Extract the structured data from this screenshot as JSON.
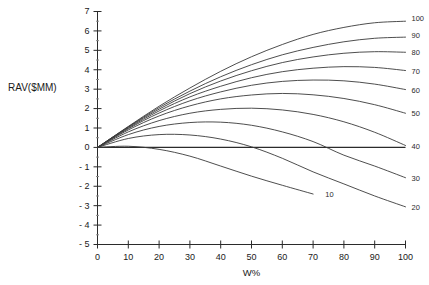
{
  "chart_data": {
    "type": "line",
    "title": "",
    "xlabel": "W%",
    "ylabel": "RAV($MM)",
    "xlim": [
      0,
      100
    ],
    "ylim": [
      -5,
      7
    ],
    "grid": false,
    "legend_position": "right-inline-labels",
    "x_ticks": [
      "0",
      "10",
      "20",
      "30",
      "40",
      "50",
      "60",
      "70",
      "80",
      "90",
      "100"
    ],
    "x_tick_values": [
      0,
      10,
      20,
      30,
      40,
      50,
      60,
      70,
      80,
      90,
      100
    ],
    "y_ticks": [
      "7",
      "6",
      "5",
      "4",
      "3",
      "2",
      "1",
      "0",
      "- 1",
      "- 2",
      "- 3",
      "- 4",
      "- 5"
    ],
    "y_tick_values": [
      7,
      6,
      5,
      4,
      3,
      2,
      1,
      0,
      -1,
      -2,
      -3,
      -4,
      -5
    ],
    "x": [
      0,
      10,
      20,
      30,
      40,
      50,
      60,
      70,
      80,
      90,
      100
    ],
    "series": [
      {
        "name": "100",
        "label": "100",
        "label_x": 100,
        "label_y": 6.6,
        "values": [
          0,
          1.08,
          2.12,
          3.06,
          3.92,
          4.67,
          5.3,
          5.82,
          6.18,
          6.42,
          6.5
        ]
      },
      {
        "name": "90",
        "label": "90",
        "label_x": 100,
        "label_y": 5.72,
        "values": [
          0,
          1.06,
          2.05,
          2.9,
          3.64,
          4.26,
          4.77,
          5.15,
          5.44,
          5.62,
          5.68
        ]
      },
      {
        "name": "80",
        "label": "80",
        "label_x": 100,
        "label_y": 4.85,
        "values": [
          0,
          1.04,
          1.97,
          2.77,
          3.42,
          3.95,
          4.37,
          4.66,
          4.85,
          4.93,
          4.9
        ]
      },
      {
        "name": "70",
        "label": "70",
        "label_x": 100,
        "label_y": 3.9,
        "values": [
          0,
          1.0,
          1.88,
          2.6,
          3.15,
          3.59,
          3.9,
          4.08,
          4.16,
          4.12,
          3.96
        ]
      },
      {
        "name": "60",
        "label": "60",
        "label_x": 100,
        "label_y": 2.92,
        "values": [
          0,
          0.96,
          1.77,
          2.4,
          2.86,
          3.2,
          3.4,
          3.47,
          3.43,
          3.26,
          2.98
        ]
      },
      {
        "name": "50",
        "label": "50",
        "label_x": 100,
        "label_y": 1.7,
        "values": [
          0,
          0.9,
          1.62,
          2.14,
          2.5,
          2.7,
          2.78,
          2.71,
          2.52,
          2.2,
          1.76
        ]
      },
      {
        "name": "40",
        "label": "40",
        "label_x": 100,
        "label_y": 0.0,
        "values": [
          0,
          0.8,
          1.38,
          1.76,
          1.96,
          2.02,
          1.93,
          1.7,
          1.32,
          0.78,
          0.1
        ]
      },
      {
        "name": "30",
        "label": "30",
        "label_x": 100,
        "label_y": -1.62,
        "values": [
          0,
          0.66,
          1.08,
          1.28,
          1.3,
          1.14,
          0.8,
          0.3,
          -0.4,
          -0.96,
          -1.56
        ]
      },
      {
        "name": "20",
        "label": "20",
        "label_x": 100,
        "label_y": -3.12,
        "values": [
          0,
          0.46,
          0.66,
          0.64,
          0.43,
          0.03,
          -0.56,
          -1.26,
          -1.88,
          -2.5,
          -3.06
        ]
      },
      {
        "name": "10",
        "label": "10",
        "label_x": 72,
        "label_y": -2.45,
        "x": [
          0,
          10,
          20,
          30,
          40,
          50,
          60,
          70
        ],
        "values": [
          0,
          0.06,
          -0.1,
          -0.45,
          -0.96,
          -1.48,
          -1.95,
          -2.4
        ]
      }
    ]
  },
  "axes": {
    "y_axis_title": "RAV($MM)",
    "x_axis_title": "W%"
  }
}
